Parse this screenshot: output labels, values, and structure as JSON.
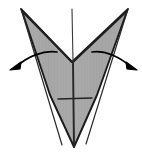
{
  "figure": {
    "type": "origami-fold-diagram",
    "canvas": {
      "width": 142,
      "height": 154,
      "background": "#ffffff"
    },
    "colors": {
      "paper_fill": "#a9a9a9",
      "paper_fill_shadow": "#9d9d9d",
      "outline": "#1a1a1a",
      "crease": "#262626",
      "arrow": "#000000",
      "background": "#ffffff"
    },
    "shape": {
      "name": "inverted-kite-with-v-notch",
      "outline_points": "21,9 72,62 128,9 126,14 97,95 74,147 50,95 23,14",
      "top_left_corner": "21,9",
      "top_right_corner": "128,9",
      "center_notch_vertex": "72,62",
      "bottom_apex": "74,147"
    },
    "creases": [
      {
        "name": "center-vertical-crease",
        "d": "M 72 9 L 73 62"
      },
      {
        "name": "center-vertical-crease-lower",
        "d": "M 73 62 L 74 147"
      },
      {
        "name": "left-diagonal-fold",
        "d": "M 22 11 L 72 62"
      },
      {
        "name": "right-diagonal-fold",
        "d": "M 127 11 L 73 62"
      },
      {
        "name": "left-inner-edge",
        "d": "M 22 12 L 62 145"
      },
      {
        "name": "right-inner-edge",
        "d": "M 127 12 L 86 144"
      },
      {
        "name": "horizontal-crease",
        "d": "M 58 99 L 92 98"
      }
    ],
    "arrows": [
      {
        "name": "left-fold-arrow",
        "direction": "out-to-lower-left",
        "path": "M 57 52 C 44 50 28 56 16 67",
        "head_points": "10,70 21,62 20,69"
      },
      {
        "name": "right-fold-arrow",
        "direction": "out-to-lower-right",
        "path": "M 92 52 C 105 50 120 57 131 67",
        "head_points": "137,70 126,62 127,69"
      }
    ]
  }
}
